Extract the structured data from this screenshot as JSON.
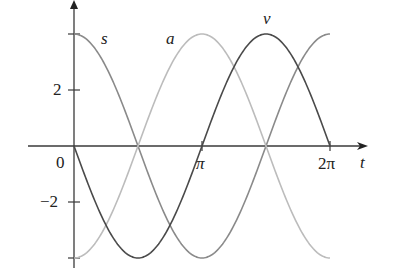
{
  "chart_data": {
    "type": "line",
    "title": "",
    "xlabel": "t",
    "ylabel": "",
    "x_ticks": [
      "0",
      "π",
      "2π"
    ],
    "x_tick_values": [
      0,
      3.14159,
      6.28318
    ],
    "y_ticks": [
      "−2",
      "2"
    ],
    "y_tick_values": [
      -2,
      2
    ],
    "y_range_tick_marks": [
      -4,
      -2,
      2,
      4
    ],
    "xlim": [
      0,
      6.2832
    ],
    "ylim": [
      -4,
      4
    ],
    "grid": false,
    "legend": "inline curve labels",
    "series": [
      {
        "name": "s",
        "formula": "4cos(t)",
        "color": "#8a8a8a",
        "x": [
          0,
          0.785,
          1.571,
          2.356,
          3.142,
          3.927,
          4.712,
          5.498,
          6.283
        ],
        "values": [
          4,
          2.83,
          0,
          -2.83,
          -4,
          -2.83,
          0,
          2.83,
          4
        ]
      },
      {
        "name": "a",
        "formula": "-4cos(t)",
        "color": "#bcbcbc",
        "x": [
          0,
          0.785,
          1.571,
          2.356,
          3.142,
          3.927,
          4.712,
          5.498,
          6.283
        ],
        "values": [
          -4,
          -2.83,
          0,
          2.83,
          4,
          2.83,
          0,
          -2.83,
          -4
        ]
      },
      {
        "name": "v",
        "formula": "-4sin(t)",
        "color": "#4a4a4a",
        "x": [
          0,
          0.785,
          1.571,
          2.356,
          3.142,
          3.927,
          4.712,
          5.498,
          6.283
        ],
        "values": [
          0,
          -2.83,
          -4,
          -2.83,
          0,
          2.83,
          4,
          2.83,
          0
        ]
      }
    ]
  },
  "labels": {
    "s": "s",
    "a": "a",
    "v": "v",
    "t": "t",
    "zero": "0",
    "pi": "π",
    "two_pi": "2π",
    "two": "2",
    "neg_two": "−2"
  }
}
